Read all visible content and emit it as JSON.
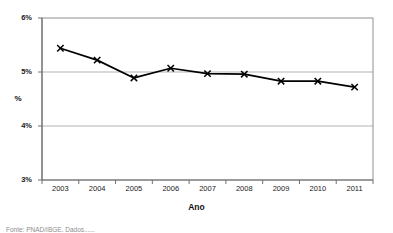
{
  "chart_data": {
    "type": "line",
    "title": "",
    "subtitle": "",
    "xlabel": "Ano",
    "ylabel": "%",
    "categories": [
      "2003",
      "2004",
      "2005",
      "2006",
      "2007",
      "2008",
      "2009",
      "2010",
      "2011"
    ],
    "values": [
      5.44,
      5.22,
      4.89,
      5.07,
      4.97,
      4.96,
      4.83,
      4.83,
      4.72
    ],
    "series": [
      {
        "name": "%",
        "values": [
          5.44,
          5.22,
          4.89,
          5.07,
          4.97,
          4.96,
          4.83,
          4.83,
          4.72
        ]
      }
    ],
    "ylim": [
      3,
      6
    ],
    "ytick_labels": [
      "3%",
      "4%",
      "5%",
      "6%"
    ],
    "ytick_values": [
      3,
      4,
      5,
      6
    ],
    "xtick_labels": [
      "2003",
      "2004",
      "2005",
      "2006",
      "2007",
      "2008",
      "2009",
      "2010",
      "2011"
    ],
    "grid": "horizontal",
    "gridlines_at": [
      4,
      5
    ],
    "legend": "none",
    "marker": "x",
    "line_color": "#000000",
    "grid_color": "#b3b3b3",
    "border_color": "#808080",
    "plot_background": "#ffffff"
  },
  "axis_titles": {
    "y": "%",
    "x": "Ano"
  },
  "caption": {
    "text": "Fonte: PNAD/IBGE. Dados......"
  }
}
